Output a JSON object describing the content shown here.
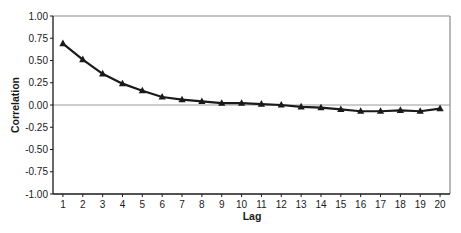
{
  "chart_data": {
    "type": "line",
    "title": "",
    "xlabel": "Lag",
    "ylabel": "Correlation",
    "x": [
      1,
      2,
      3,
      4,
      5,
      6,
      7,
      8,
      9,
      10,
      11,
      12,
      13,
      14,
      15,
      16,
      17,
      18,
      19,
      20
    ],
    "series": [
      {
        "name": "Correlation",
        "marker": "triangle",
        "color": "#1a1a1a",
        "values": [
          0.69,
          0.51,
          0.35,
          0.24,
          0.16,
          0.09,
          0.06,
          0.04,
          0.02,
          0.02,
          0.01,
          0.0,
          -0.02,
          -0.03,
          -0.05,
          -0.07,
          -0.07,
          -0.06,
          -0.07,
          -0.04
        ]
      }
    ],
    "ylim": [
      -1.0,
      1.0
    ],
    "xlim": [
      0.5,
      20.5
    ],
    "yticks": [
      "1.00",
      "0.75",
      "0.50",
      "0.25",
      "0.00",
      "-0.25",
      "-0.50",
      "-0.75",
      "-1.00"
    ],
    "ytick_values": [
      1.0,
      0.75,
      0.5,
      0.25,
      0.0,
      -0.25,
      -0.5,
      -0.75,
      -1.0
    ],
    "xticks": [
      "1",
      "2",
      "3",
      "4",
      "5",
      "6",
      "7",
      "8",
      "9",
      "10",
      "11",
      "12",
      "13",
      "14",
      "15",
      "16",
      "17",
      "18",
      "19",
      "20"
    ],
    "grid": false,
    "zero_line": true,
    "legend": null
  },
  "colors": {
    "line": "#1a1a1a",
    "zero_line": "#9a9a9a",
    "frame": "#8a8a8a",
    "axis": "#1a1a1a"
  }
}
